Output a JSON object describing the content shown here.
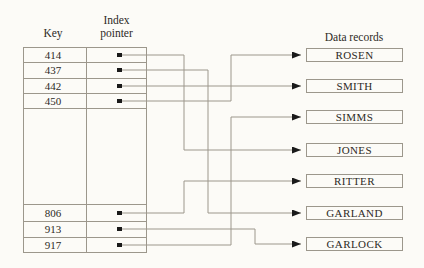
{
  "diagram": {
    "headers": {
      "key_column": "Key",
      "index_column_line1": "Index",
      "index_column_line2": "pointer",
      "records_title": "Data records"
    },
    "keys": [
      "414",
      "437",
      "442",
      "450",
      "806",
      "913",
      "917"
    ],
    "records": [
      "ROSEN",
      "SMITH",
      "SIMMS",
      "JONES",
      "RITTER",
      "GARLAND",
      "GARLOCK"
    ],
    "mapping": [
      {
        "key": "414",
        "record": "JONES"
      },
      {
        "key": "437",
        "record": "GARLAND"
      },
      {
        "key": "442",
        "record": "SMITH"
      },
      {
        "key": "450",
        "record": "ROSEN"
      },
      {
        "key": "806",
        "record": "RITTER"
      },
      {
        "key": "913",
        "record": "GARLOCK"
      },
      {
        "key": "917",
        "record": "SIMMS"
      }
    ],
    "wires": [
      {
        "from": "414",
        "to": "JONES",
        "points": [
          [
            122,
            55
          ],
          [
            184,
            55
          ],
          [
            184,
            150
          ],
          [
            301,
            150
          ]
        ]
      },
      {
        "from": "437",
        "to": "GARLAND",
        "points": [
          [
            122,
            70
          ],
          [
            208,
            70
          ],
          [
            208,
            213
          ],
          [
            301,
            213
          ]
        ]
      },
      {
        "from": "442",
        "to": "SMITH",
        "points": [
          [
            122,
            86
          ],
          [
            301,
            86
          ]
        ]
      },
      {
        "from": "450",
        "to": "ROSEN",
        "points": [
          [
            122,
            101
          ],
          [
            231,
            101
          ],
          [
            231,
            55
          ],
          [
            301,
            55
          ]
        ]
      },
      {
        "from": "806",
        "to": "RITTER",
        "points": [
          [
            122,
            213
          ],
          [
            184,
            213
          ],
          [
            184,
            181
          ],
          [
            301,
            181
          ]
        ]
      },
      {
        "from": "913",
        "to": "GARLOCK",
        "points": [
          [
            122,
            229
          ],
          [
            255,
            229
          ],
          [
            255,
            244
          ],
          [
            301,
            244
          ]
        ]
      },
      {
        "from": "917",
        "to": "SIMMS",
        "points": [
          [
            122,
            245
          ],
          [
            231,
            245
          ],
          [
            231,
            117
          ],
          [
            301,
            117
          ]
        ]
      }
    ],
    "colors": {
      "line": "#9c978c",
      "marker": "#1a1a1a",
      "text": "#2d2a25",
      "background": "#fcfbf7"
    }
  }
}
